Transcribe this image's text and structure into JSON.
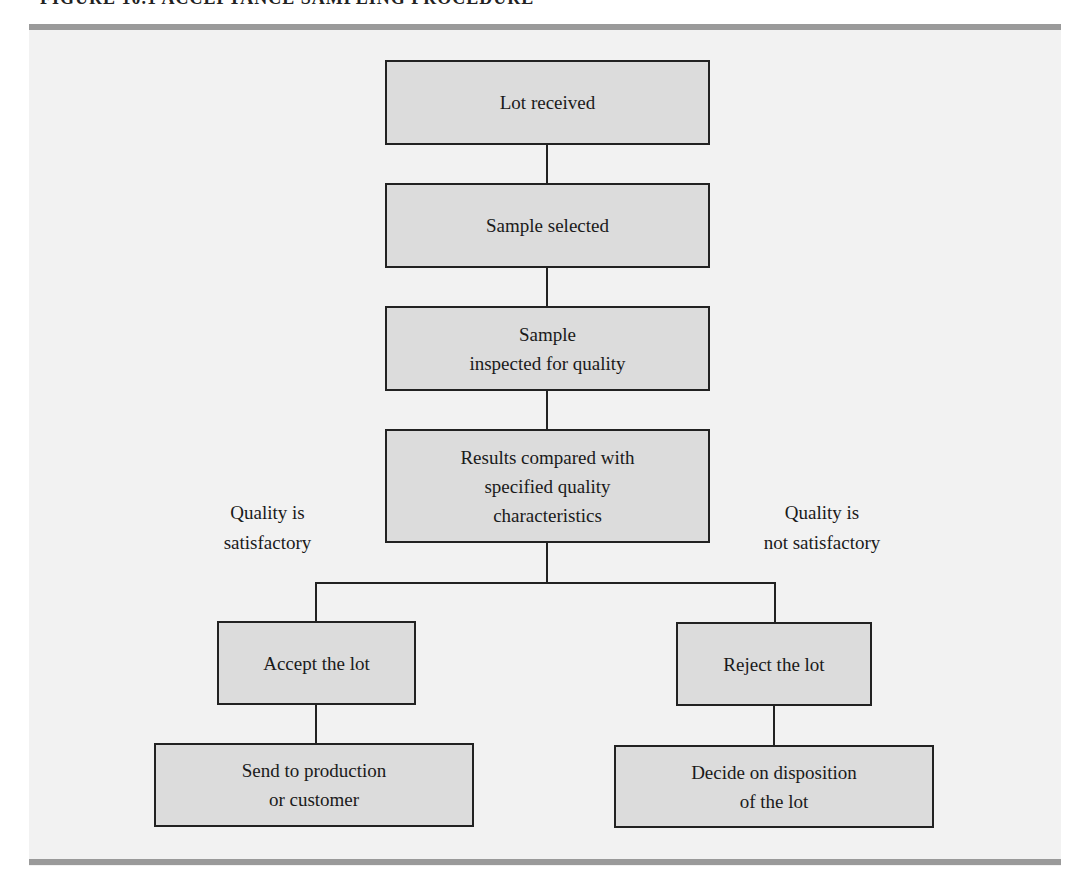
{
  "caption": "FIGURE 10.1    ACCEPTANCE SAMPLING PROCEDURE",
  "flowchart": {
    "main_steps": [
      {
        "label": "Lot received"
      },
      {
        "label": "Sample selected"
      },
      {
        "label": "Sample\ninspected for quality"
      },
      {
        "label": "Results compared with\nspecified quality\ncharacteristics"
      }
    ],
    "branches": {
      "left": {
        "condition": "Quality is\nsatisfactory",
        "steps": [
          {
            "label": "Accept the lot"
          },
          {
            "label": "Send to production\nor customer"
          }
        ]
      },
      "right": {
        "condition": "Quality is\nnot satisfactory",
        "steps": [
          {
            "label": "Reject the lot"
          },
          {
            "label": "Decide on disposition\nof the lot"
          }
        ]
      }
    }
  },
  "colors": {
    "panel_background": "#f2f2f2",
    "box_fill": "#dcdcdc",
    "rule": "#9a9a9a",
    "stroke": "#222222"
  }
}
